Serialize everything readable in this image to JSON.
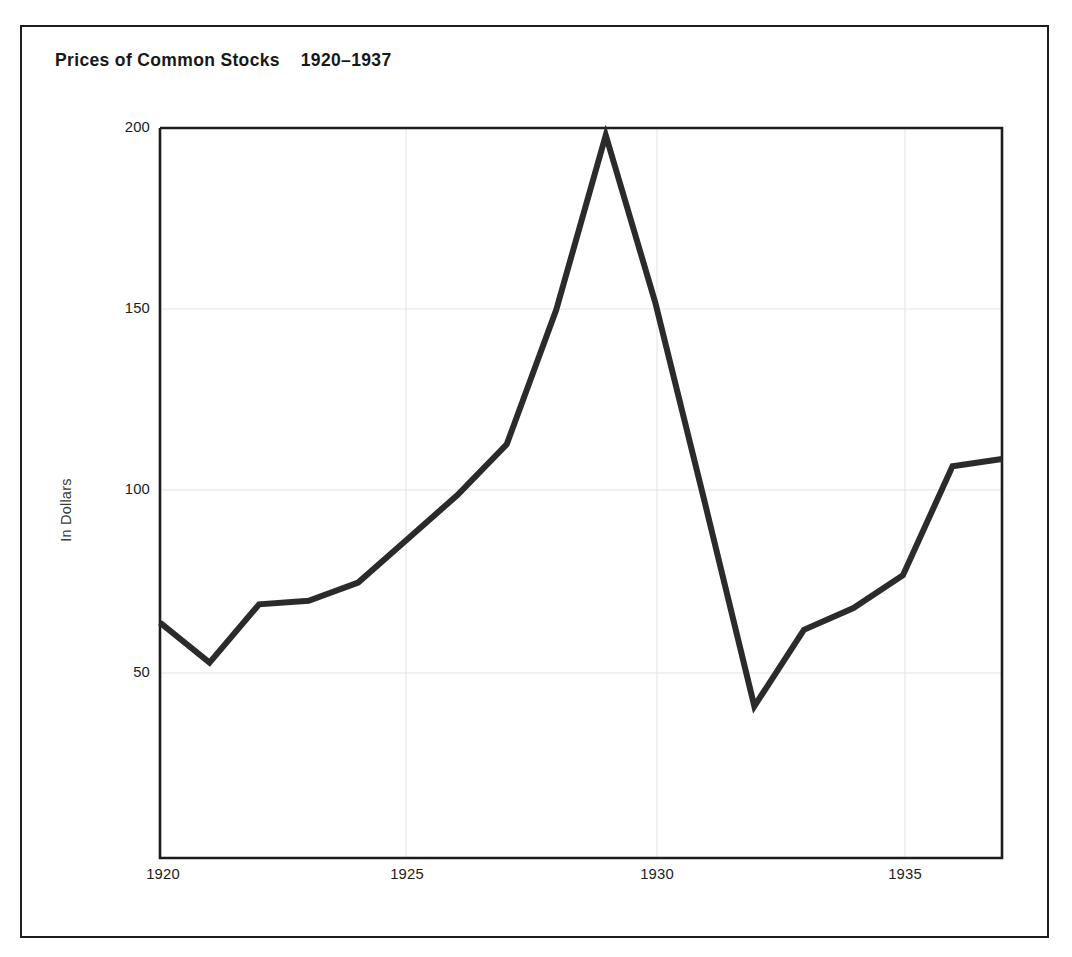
{
  "figure": {
    "title": "Prices of Common Stocks    1920–1937",
    "background_color": "#ffffff",
    "frame_color": "#1d1d1d",
    "series_color": "#2b2b2b",
    "grid_color": "#e3e3e3"
  },
  "chart_data": {
    "type": "line",
    "title": "Prices of Common Stocks    1920–1937",
    "xlabel": "",
    "ylabel": "In Dollars",
    "x": [
      1920,
      1921,
      1922,
      1923,
      1924,
      1925,
      1926,
      1927,
      1928,
      1929,
      1930,
      1931,
      1932,
      1933,
      1934,
      1935,
      1936,
      1937
    ],
    "values": [
      64,
      53,
      69,
      70,
      75,
      87,
      99,
      113,
      150,
      198,
      152,
      97,
      41,
      62,
      68,
      77,
      107,
      109
    ],
    "series": [
      {
        "name": "Prices of Common Stocks",
        "values": [
          64,
          53,
          69,
          70,
          75,
          87,
          99,
          113,
          150,
          198,
          152,
          97,
          41,
          62,
          68,
          77,
          107,
          109
        ]
      }
    ],
    "xlim": [
      1920,
      1937
    ],
    "ylim": [
      0,
      200
    ],
    "xticks": [
      1920,
      1925,
      1930,
      1935
    ],
    "xtick_labels": [
      "1920",
      "1925",
      "1930",
      "1935"
    ],
    "yticks": [
      50,
      100,
      150,
      200
    ],
    "ytick_labels": [
      "50",
      "100",
      "150",
      "200"
    ],
    "grid": true,
    "grid_axes": "both",
    "legend": false,
    "legend_position": "none",
    "annotations": [],
    "line_width_px": 6
  },
  "axis": {
    "y_title": "In Dollars",
    "y_tick_labels": [
      "200",
      "150",
      "100",
      "50"
    ],
    "x_tick_labels": [
      "1920",
      "1925",
      "1930",
      "1935"
    ]
  }
}
